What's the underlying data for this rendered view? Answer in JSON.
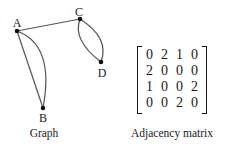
{
  "graph": {
    "caption": "Graph",
    "nodes": [
      {
        "id": "A",
        "label": "A",
        "x": 17,
        "y": 31
      },
      {
        "id": "B",
        "label": "B",
        "x": 43,
        "y": 108
      },
      {
        "id": "C",
        "label": "C",
        "x": 80,
        "y": 19
      },
      {
        "id": "D",
        "label": "D",
        "x": 101,
        "y": 62
      }
    ],
    "edges": [
      {
        "from": "A",
        "to": "B",
        "count": 2
      },
      {
        "from": "A",
        "to": "C",
        "count": 1
      },
      {
        "from": "C",
        "to": "D",
        "count": 2
      }
    ]
  },
  "matrix": {
    "caption": "Adjacency matrix",
    "rows": [
      [
        "0",
        "2",
        "1",
        "0"
      ],
      [
        "2",
        "0",
        "0",
        "0"
      ],
      [
        "1",
        "0",
        "0",
        "2"
      ],
      [
        "0",
        "0",
        "2",
        "0"
      ]
    ]
  },
  "colors": {
    "edge": "#555555",
    "node": "#111111",
    "text": "#1a1a1a"
  }
}
